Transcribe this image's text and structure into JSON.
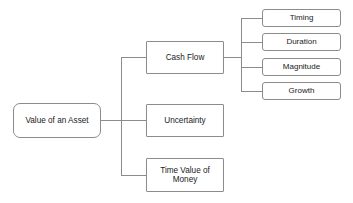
{
  "diagram": {
    "type": "tree",
    "title": "Value of an Asset",
    "orientation": "left-to-right",
    "background_color": "#ffffff",
    "line_color": "#8c8c8c",
    "border_color": "#8c8c8c",
    "text_color": "#1a1a1a",
    "root": {
      "label": "Value of an Asset",
      "x": 13,
      "y": 103,
      "w": 88,
      "h": 35
    },
    "level1": [
      {
        "label": "Cash Flow",
        "x": 146,
        "y": 41,
        "w": 78,
        "h": 33
      },
      {
        "label": "Uncertainty",
        "x": 146,
        "y": 104,
        "w": 78,
        "h": 33
      },
      {
        "label": "Time Value of\nMoney",
        "x": 146,
        "y": 158,
        "w": 78,
        "h": 34
      }
    ],
    "leaves": [
      {
        "label": "Timing",
        "x": 262,
        "y": 9,
        "w": 79,
        "h": 18
      },
      {
        "label": "Duration",
        "x": 262,
        "y": 33,
        "w": 79,
        "h": 18
      },
      {
        "label": "Magnitude",
        "x": 262,
        "y": 58,
        "w": 79,
        "h": 18
      },
      {
        "label": "Growth",
        "x": 262,
        "y": 82,
        "w": 79,
        "h": 18
      }
    ],
    "connectors": {
      "root_stub": {
        "x1": 101,
        "y1": 120.5,
        "x2": 121,
        "y2": 120.5
      },
      "trunk1": {
        "x": 121,
        "y1": 57.5,
        "y2": 175
      },
      "branches1": [
        {
          "x1": 121,
          "y": 57.5,
          "x2": 146
        },
        {
          "x1": 121,
          "y": 120.5,
          "x2": 146
        },
        {
          "x1": 121,
          "y": 175,
          "x2": 146
        }
      ],
      "cashflow_stub": {
        "x1": 224,
        "y1": 57.5,
        "x2": 241,
        "y2": 57.5
      },
      "trunk2": {
        "x": 241,
        "y1": 18,
        "y2": 91
      },
      "branches2": [
        {
          "x1": 241,
          "y": 18,
          "x2": 262
        },
        {
          "x1": 241,
          "y": 42,
          "x2": 262
        },
        {
          "x1": 241,
          "y": 67,
          "x2": 262
        },
        {
          "x1": 241,
          "y": 91,
          "x2": 262
        }
      ]
    }
  }
}
